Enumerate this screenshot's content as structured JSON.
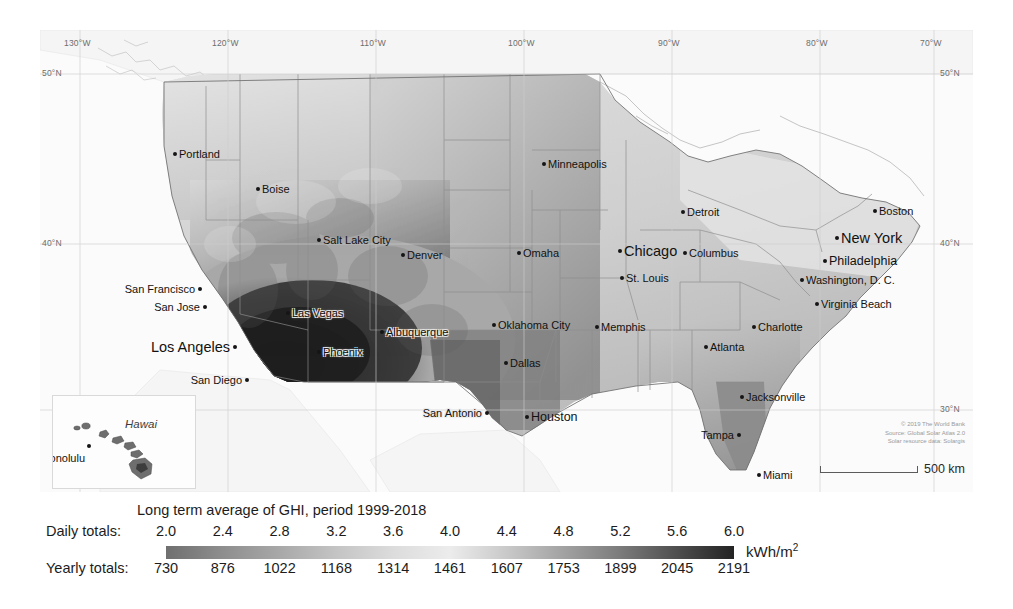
{
  "figure": {
    "kind": "solar-resource-map",
    "region": "United States"
  },
  "map": {
    "background_color": "#f2f2f2",
    "ocean_color": "#fbfbfb",
    "border_color": "#8e8e8e",
    "graticule_color": "#cfcfcf",
    "lon_labels": [
      "130°W",
      "120°W",
      "110°W",
      "100°W",
      "90°W",
      "80°W",
      "70°W"
    ],
    "lat_labels_left": [
      "50°N",
      "40°N"
    ],
    "lat_labels_right": [
      "50°N",
      "40°N",
      "30°N"
    ],
    "cities": [
      {
        "name": "Portland",
        "x": 133,
        "y": 122,
        "size": "small",
        "anchor": "left",
        "halo": false
      },
      {
        "name": "Boise",
        "x": 216,
        "y": 157,
        "size": "small",
        "anchor": "left",
        "halo": false
      },
      {
        "name": "Salt Lake City",
        "x": 277,
        "y": 208,
        "size": "small",
        "anchor": "left",
        "halo": false
      },
      {
        "name": "San Francisco",
        "x": 158,
        "y": 257,
        "size": "small",
        "anchor": "right",
        "halo": false
      },
      {
        "name": "San Jose",
        "x": 163,
        "y": 275,
        "size": "small",
        "anchor": "right",
        "halo": false
      },
      {
        "name": "Los Angeles",
        "x": 193,
        "y": 315,
        "size": "big",
        "anchor": "right",
        "halo": false
      },
      {
        "name": "San Diego",
        "x": 205,
        "y": 348,
        "size": "small",
        "anchor": "right",
        "halo": false
      },
      {
        "name": "Las Vegas",
        "x": 246,
        "y": 281,
        "size": "small",
        "anchor": "left",
        "halo": true
      },
      {
        "name": "Phoenix",
        "x": 277,
        "y": 320,
        "size": "small",
        "anchor": "left",
        "halo": true
      },
      {
        "name": "Albuquerque",
        "x": 340,
        "y": 300,
        "size": "small",
        "anchor": "left",
        "halo": true
      },
      {
        "name": "Denver",
        "x": 361,
        "y": 223,
        "size": "small",
        "anchor": "left",
        "halo": false
      },
      {
        "name": "Minneapolis",
        "x": 502,
        "y": 132,
        "size": "small",
        "anchor": "left",
        "halo": false
      },
      {
        "name": "Omaha",
        "x": 477,
        "y": 221,
        "size": "small",
        "anchor": "left",
        "halo": false
      },
      {
        "name": "St. Louis",
        "x": 580,
        "y": 246,
        "size": "small",
        "anchor": "left",
        "halo": false
      },
      {
        "name": "Oklahoma City",
        "x": 452,
        "y": 293,
        "size": "small",
        "anchor": "left",
        "halo": false
      },
      {
        "name": "Dallas",
        "x": 464,
        "y": 331,
        "size": "small",
        "anchor": "left",
        "halo": false
      },
      {
        "name": "San Antonio",
        "x": 445,
        "y": 381,
        "size": "small",
        "anchor": "right",
        "halo": true
      },
      {
        "name": "Houston",
        "x": 485,
        "y": 385,
        "size": "mid",
        "anchor": "left",
        "halo": false
      },
      {
        "name": "Memphis",
        "x": 555,
        "y": 295,
        "size": "small",
        "anchor": "left",
        "halo": false
      },
      {
        "name": "Chicago",
        "x": 578,
        "y": 219,
        "size": "big",
        "anchor": "left",
        "halo": false
      },
      {
        "name": "Detroit",
        "x": 641,
        "y": 180,
        "size": "small",
        "anchor": "left",
        "halo": false
      },
      {
        "name": "Columbus",
        "x": 643,
        "y": 221,
        "size": "small",
        "anchor": "left",
        "halo": false
      },
      {
        "name": "Boston",
        "x": 833,
        "y": 179,
        "size": "small",
        "anchor": "left",
        "halo": false
      },
      {
        "name": "New York",
        "x": 795,
        "y": 206,
        "size": "big",
        "anchor": "left",
        "halo": false
      },
      {
        "name": "Philadelphia",
        "x": 783,
        "y": 229,
        "size": "mid",
        "anchor": "left",
        "halo": false
      },
      {
        "name": "Washington, D. C.",
        "x": 760,
        "y": 248,
        "size": "small",
        "anchor": "left",
        "halo": false
      },
      {
        "name": "Virginia Beach",
        "x": 775,
        "y": 272,
        "size": "small",
        "anchor": "left",
        "halo": false
      },
      {
        "name": "Charlotte",
        "x": 712,
        "y": 295,
        "size": "small",
        "anchor": "left",
        "halo": false
      },
      {
        "name": "Atlanta",
        "x": 664,
        "y": 315,
        "size": "small",
        "anchor": "left",
        "halo": false
      },
      {
        "name": "Jacksonville",
        "x": 700,
        "y": 365,
        "size": "small",
        "anchor": "left",
        "halo": false
      },
      {
        "name": "Tampa",
        "x": 697,
        "y": 403,
        "size": "small",
        "anchor": "right",
        "halo": false
      },
      {
        "name": "Miami",
        "x": 717,
        "y": 443,
        "size": "small",
        "anchor": "left",
        "halo": false
      }
    ],
    "inset": {
      "title": "Hawai",
      "city": "Honolulu"
    },
    "attribution": [
      "© 2019 The World Bank",
      "Source: Global Solar Atlas 2.0",
      "Solar resource data: Solargis"
    ],
    "scalebar": {
      "label": "500 km"
    }
  },
  "legend": {
    "title": "Long term average of GHI, period 1999-2018",
    "daily_label": "Daily totals:",
    "yearly_label": "Yearly totals:",
    "unit": "kWh/m",
    "unit_sup": "2",
    "daily_values": [
      "2.0",
      "2.4",
      "2.8",
      "3.2",
      "3.6",
      "4.0",
      "4.4",
      "4.8",
      "5.2",
      "5.6",
      "6.0"
    ],
    "yearly_values": [
      "730",
      "876",
      "1022",
      "1168",
      "1314",
      "1461",
      "1607",
      "1753",
      "1899",
      "2045",
      "2191"
    ]
  },
  "chart_data": {
    "type": "heatmap",
    "title": "Long term average of GHI, period 1999-2018",
    "variable": "Global Horizontal Irradiation (GHI)",
    "unit_daily": "kWh/m2 per day",
    "unit_yearly": "kWh/m2 per year",
    "period": "1999-2018",
    "region": "United States of America",
    "colormap": "grayscale (light = low GHI, dark = high GHI)",
    "daily_ticks": [
      2.0,
      2.4,
      2.8,
      3.2,
      3.6,
      4.0,
      4.4,
      4.8,
      5.2,
      5.6,
      6.0
    ],
    "yearly_ticks": [
      730,
      876,
      1022,
      1168,
      1314,
      1461,
      1607,
      1753,
      1899,
      2045,
      2191
    ],
    "daily_range": [
      2.0,
      6.0
    ],
    "yearly_range": [
      730,
      2191
    ],
    "xlabel": "Longitude",
    "ylabel": "Latitude",
    "xlim": [
      -132,
      -66
    ],
    "ylim": [
      24,
      52
    ],
    "grid": true,
    "legend_position": "bottom",
    "colorbar_stops": [
      {
        "value": 2.0,
        "color": "#6f6f6f"
      },
      {
        "value": 2.4,
        "color": "#8e8e8e"
      },
      {
        "value": 2.8,
        "color": "#a8a8a8"
      },
      {
        "value": 3.2,
        "color": "#c4c4c4"
      },
      {
        "value": 3.6,
        "color": "#dcdcdc"
      },
      {
        "value": 4.0,
        "color": "#ececec"
      },
      {
        "value": 4.4,
        "color": "#c9c9c9"
      },
      {
        "value": 4.8,
        "color": "#a2a2a2"
      },
      {
        "value": 5.2,
        "color": "#7b7b7b"
      },
      {
        "value": 5.6,
        "color": "#4e4e4e"
      },
      {
        "value": 6.0,
        "color": "#232323"
      }
    ],
    "city_markers": [
      {
        "name": "Portland",
        "lat": 45.5,
        "lon": -122.7
      },
      {
        "name": "Boise",
        "lat": 43.6,
        "lon": -116.2
      },
      {
        "name": "Salt Lake City",
        "lat": 40.8,
        "lon": -111.9
      },
      {
        "name": "San Francisco",
        "lat": 37.8,
        "lon": -122.4
      },
      {
        "name": "San Jose",
        "lat": 37.3,
        "lon": -121.9
      },
      {
        "name": "Los Angeles",
        "lat": 34.1,
        "lon": -118.2
      },
      {
        "name": "San Diego",
        "lat": 32.7,
        "lon": -117.2
      },
      {
        "name": "Las Vegas",
        "lat": 36.2,
        "lon": -115.1
      },
      {
        "name": "Phoenix",
        "lat": 33.4,
        "lon": -112.1
      },
      {
        "name": "Albuquerque",
        "lat": 35.1,
        "lon": -106.6
      },
      {
        "name": "Denver",
        "lat": 39.7,
        "lon": -105.0
      },
      {
        "name": "Minneapolis",
        "lat": 45.0,
        "lon": -93.3
      },
      {
        "name": "Omaha",
        "lat": 41.3,
        "lon": -95.9
      },
      {
        "name": "St. Louis",
        "lat": 38.6,
        "lon": -90.2
      },
      {
        "name": "Oklahoma City",
        "lat": 35.5,
        "lon": -97.5
      },
      {
        "name": "Dallas",
        "lat": 32.8,
        "lon": -96.8
      },
      {
        "name": "San Antonio",
        "lat": 29.4,
        "lon": -98.5
      },
      {
        "name": "Houston",
        "lat": 29.8,
        "lon": -95.4
      },
      {
        "name": "Memphis",
        "lat": 35.1,
        "lon": -90.0
      },
      {
        "name": "Chicago",
        "lat": 41.9,
        "lon": -87.6
      },
      {
        "name": "Detroit",
        "lat": 42.3,
        "lon": -83.0
      },
      {
        "name": "Columbus",
        "lat": 40.0,
        "lon": -83.0
      },
      {
        "name": "Boston",
        "lat": 42.4,
        "lon": -71.1
      },
      {
        "name": "New York",
        "lat": 40.7,
        "lon": -74.0
      },
      {
        "name": "Philadelphia",
        "lat": 39.95,
        "lon": -75.2
      },
      {
        "name": "Washington, D. C.",
        "lat": 38.9,
        "lon": -77.0
      },
      {
        "name": "Virginia Beach",
        "lat": 36.9,
        "lon": -76.0
      },
      {
        "name": "Charlotte",
        "lat": 35.2,
        "lon": -80.8
      },
      {
        "name": "Atlanta",
        "lat": 33.7,
        "lon": -84.4
      },
      {
        "name": "Jacksonville",
        "lat": 30.3,
        "lon": -81.7
      },
      {
        "name": "Tampa",
        "lat": 27.9,
        "lon": -82.5
      },
      {
        "name": "Miami",
        "lat": 25.8,
        "lon": -80.2
      },
      {
        "name": "Honolulu",
        "lat": 21.3,
        "lon": -157.9
      }
    ],
    "regional_notes": [
      {
        "region": "Southwest (AZ, NV, SE CA, NM)",
        "daily_ghi": 5.6,
        "description": "highest GHI, darkest shading"
      },
      {
        "region": "Pacific Northwest",
        "daily_ghi": 3.2,
        "description": "lowest GHI in contiguous US"
      },
      {
        "region": "Great Lakes / Northeast",
        "daily_ghi": 3.6,
        "description": "low GHI"
      },
      {
        "region": "Southeast (FL, GA)",
        "daily_ghi": 4.8,
        "description": "moderately high GHI"
      },
      {
        "region": "Great Plains",
        "daily_ghi": 4.4,
        "description": "moderate GHI"
      }
    ]
  }
}
